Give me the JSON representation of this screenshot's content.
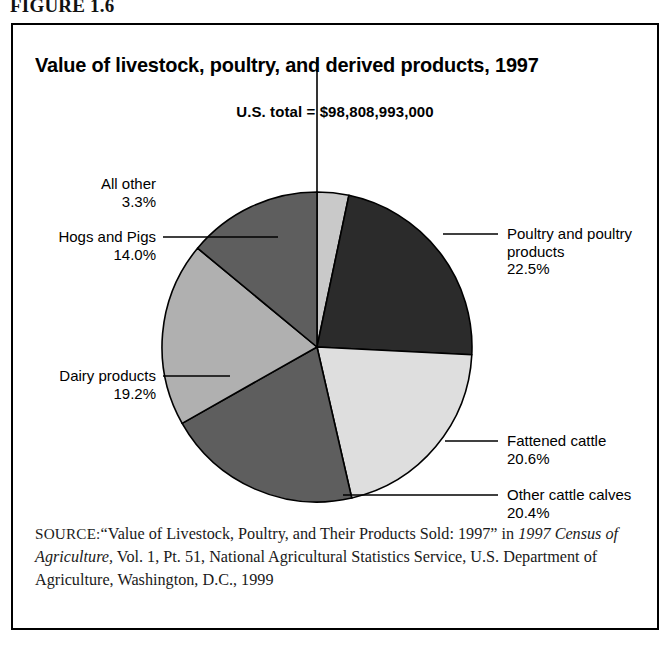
{
  "figure": {
    "number_label": "FIGURE 1.6"
  },
  "chart": {
    "title": "Value of livestock, poultry, and derived products, 1997",
    "subtitle": "U.S. total = $98,808,993,000"
  },
  "source": {
    "label": "SOURCE:",
    "text_part1": "“Value of Livestock, Poultry, and Their Products Sold: 1997” in ",
    "text_italic": "1997 Census of Agriculture,",
    "text_part2": " Vol. 1, Pt. 51, National Agricultural Statistics Service, U.S. Department of Agriculture, Washington, D.C., 1999"
  },
  "labels": {
    "all_other_name": "All other",
    "all_other_value": "3.3%",
    "hogs_name": "Hogs and Pigs",
    "hogs_value": "14.0%",
    "dairy_name": "Dairy products",
    "dairy_value": "19.2%",
    "poultry_name_line1": "Poultry and poultry",
    "poultry_name_line2": "products",
    "poultry_value": "22.5%",
    "fattened_name": "Fattened cattle",
    "fattened_value": "20.6%",
    "other_cattle_name": "Other cattle calves",
    "other_cattle_value": "20.4%"
  },
  "chart_data": {
    "type": "pie",
    "title": "Value of livestock, poultry, and derived products, 1997",
    "subtitle": "U.S. total = $98,808,993,000",
    "units": "percent of U.S. total value",
    "total_label": "U.S. total = $98,808,993,000",
    "total_value": 98808993000,
    "legend_position": "callout-labels",
    "grid": false,
    "categories": [
      "All other",
      "Poultry and poultry products",
      "Fattened cattle",
      "Other cattle calves",
      "Dairy products",
      "Hogs and Pigs"
    ],
    "values": [
      3.3,
      22.5,
      20.6,
      20.4,
      19.2,
      14.0
    ],
    "colors": [
      "#c9c9c9",
      "#2b2b2b",
      "#dedede",
      "#5e5e5e",
      "#b0b0b0",
      "#5e5e5e"
    ],
    "slices": [
      {
        "label": "All other",
        "value": 3.3,
        "color": "#c9c9c9"
      },
      {
        "label": "Poultry and poultry products",
        "value": 22.5,
        "color": "#2b2b2b"
      },
      {
        "label": "Fattened cattle",
        "value": 20.6,
        "color": "#dedede"
      },
      {
        "label": "Other cattle calves",
        "value": 20.4,
        "color": "#5e5e5e"
      },
      {
        "label": "Dairy products",
        "value": 19.2,
        "color": "#b0b0b0"
      },
      {
        "label": "Hogs and Pigs",
        "value": 14.0,
        "color": "#5e5e5e"
      }
    ]
  }
}
